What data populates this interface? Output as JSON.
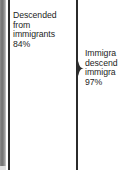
{
  "figure": {
    "type": "bracket-annotation-fragment",
    "background_color": "#ffffff",
    "text_color": "#1d1d1d",
    "rule_color": "#2b2b2b",
    "gutter_color": "#6f6f6f"
  },
  "left_group": {
    "name": "descended-from-immigrants",
    "lines": [
      "Descended",
      "from",
      "immigrants",
      "84%"
    ],
    "label": "Descended from immigrants",
    "value": "84%"
  },
  "right_group": {
    "name": "immigrants-and-descendants",
    "lines": [
      "Immigra",
      "descend",
      "immigra",
      "97%"
    ],
    "label_clipped": "Immigrants descended from immigrants",
    "value": "97%"
  },
  "brace": {
    "name": "brace-tip",
    "direction": "right",
    "glyph": "}"
  }
}
